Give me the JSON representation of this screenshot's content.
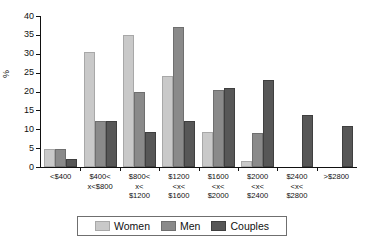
{
  "chart_data": {
    "type": "bar",
    "title": "",
    "subtitle": "",
    "xlabel": "",
    "ylabel": "%",
    "ylim": [
      0,
      40
    ],
    "yticks": [
      40,
      35,
      30,
      25,
      20,
      15,
      10,
      5,
      0
    ],
    "grid": false,
    "legend_position": "bottom",
    "categories": [
      "<$400",
      "$400< x<$800",
      "$800< x< $1200",
      "$1200 <x< $1600",
      "$1600 <x< $2000",
      "$2000 <x< $2400",
      "$2400 <x< $2800",
      ">$2800"
    ],
    "category_lines": [
      [
        "<$400"
      ],
      [
        "$400<",
        "x<$800"
      ],
      [
        "$800<",
        "x<",
        "$1200"
      ],
      [
        "$1200",
        "<x<",
        "$1600"
      ],
      [
        "$1600",
        "<x<",
        "$2000"
      ],
      [
        "$2000",
        "<x<",
        "$2400"
      ],
      [
        "$2400",
        "<x<",
        "$2800"
      ],
      [
        ">$2800"
      ]
    ],
    "series": [
      {
        "name": "Women",
        "color": "#c9c9c9",
        "values": [
          4.8,
          30.5,
          35.0,
          24.0,
          9.3,
          1.5,
          0,
          0
        ]
      },
      {
        "name": "Men",
        "color": "#8a8a8a",
        "values": [
          4.8,
          12.2,
          20.0,
          37.0,
          20.3,
          9.1,
          0,
          0
        ]
      },
      {
        "name": "Couples",
        "color": "#575757",
        "values": [
          2.1,
          12.2,
          9.3,
          12.2,
          20.8,
          23.0,
          13.8,
          10.8
        ]
      }
    ]
  },
  "legend": {
    "items": [
      {
        "label": "Women",
        "key": "women"
      },
      {
        "label": "Men",
        "key": "men"
      },
      {
        "label": "Couples",
        "key": "couples"
      }
    ]
  }
}
